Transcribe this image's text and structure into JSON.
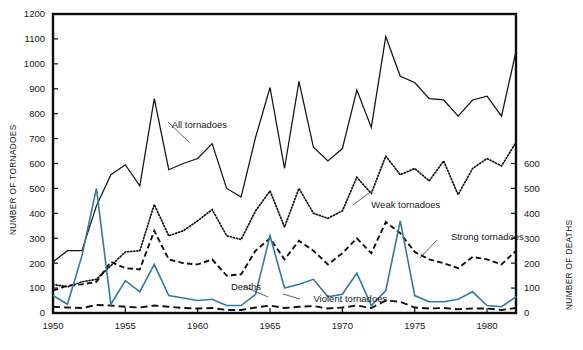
{
  "chart_data": {
    "type": "line",
    "title": "",
    "xlabel": "",
    "ylabel": "NUMBER OF TORNADOES",
    "y2label": "NUMBER OF DEATHS",
    "xlim": [
      1950,
      1982
    ],
    "ylim": [
      0,
      1200
    ],
    "y2lim": [
      0,
      600
    ],
    "grid": false,
    "legend_position": "inline-annotations",
    "x_ticks": [
      1950,
      1955,
      1960,
      1965,
      1970,
      1975,
      1980
    ],
    "x_tick_labels": [
      "1950",
      "1955",
      "1960",
      "1965",
      "1970",
      "1975",
      "1980"
    ],
    "y_ticks": [
      0,
      100,
      200,
      300,
      400,
      500,
      600,
      700,
      800,
      900,
      1000,
      1100,
      1200
    ],
    "y_tick_labels": [
      "0",
      "100",
      "200",
      "300",
      "400",
      "500",
      "600",
      "700",
      "800",
      "900",
      "1000",
      "1100",
      "1200"
    ],
    "y2_ticks": [
      0,
      100,
      200,
      300,
      400,
      500,
      600
    ],
    "y2_tick_labels": [
      "0",
      "100",
      "200",
      "300",
      "400",
      "500",
      "600"
    ],
    "x": [
      1950,
      1951,
      1952,
      1953,
      1954,
      1955,
      1956,
      1957,
      1958,
      1959,
      1960,
      1961,
      1962,
      1963,
      1964,
      1965,
      1966,
      1967,
      1968,
      1969,
      1970,
      1971,
      1972,
      1973,
      1974,
      1975,
      1976,
      1977,
      1978,
      1979,
      1980,
      1981,
      1982
    ],
    "series": [
      {
        "name": "All tornadoes",
        "style": "solid",
        "color": "#111111",
        "axis": "left",
        "label_text": "All tornadoes",
        "values": [
          205,
          250,
          250,
          430,
          555,
          595,
          510,
          860,
          575,
          600,
          620,
          680,
          500,
          465,
          705,
          905,
          580,
          930,
          665,
          610,
          660,
          895,
          745,
          1110,
          950,
          925,
          860,
          855,
          790,
          855,
          870,
          790,
          1050
        ]
      },
      {
        "name": "Weak tornadoes",
        "style": "dotted",
        "color": "#111111",
        "axis": "left",
        "label_text": "Weak tornadoes",
        "values": [
          115,
          105,
          125,
          135,
          190,
          245,
          250,
          435,
          310,
          330,
          370,
          415,
          310,
          295,
          410,
          490,
          345,
          500,
          400,
          380,
          410,
          545,
          480,
          630,
          555,
          580,
          530,
          610,
          475,
          580,
          620,
          590,
          685
        ]
      },
      {
        "name": "Strong tornadoes",
        "style": "dashed",
        "color": "#111111",
        "axis": "left",
        "label_text": "Strong tornadoes",
        "values": [
          90,
          110,
          115,
          125,
          205,
          180,
          175,
          330,
          215,
          200,
          195,
          215,
          150,
          155,
          250,
          300,
          215,
          290,
          250,
          195,
          240,
          300,
          240,
          365,
          320,
          245,
          215,
          200,
          180,
          225,
          215,
          195,
          250
        ]
      },
      {
        "name": "Violent tornadoes",
        "style": "long-dashed",
        "color": "#111111",
        "axis": "left",
        "label_text": "Violent tornadoes",
        "values": [
          25,
          22,
          20,
          32,
          30,
          25,
          22,
          30,
          25,
          20,
          18,
          20,
          12,
          12,
          22,
          30,
          20,
          25,
          28,
          18,
          22,
          30,
          20,
          50,
          45,
          22,
          18,
          20,
          15,
          18,
          18,
          12,
          20
        ]
      },
      {
        "name": "Deaths",
        "style": "solid",
        "color": "#2f7ba0",
        "axis": "right",
        "label_text": "Deaths",
        "values": [
          70,
          35,
          230,
          500,
          35,
          130,
          85,
          195,
          70,
          60,
          50,
          55,
          30,
          30,
          75,
          310,
          100,
          115,
          135,
          65,
          75,
          160,
          30,
          90,
          370,
          70,
          45,
          45,
          55,
          85,
          30,
          25,
          65
        ]
      }
    ],
    "annotations": [
      {
        "text": "All tornadoes",
        "x": 1958.2,
        "y_px": 128
      },
      {
        "text": "Weak tornadoes",
        "x": 1972.0,
        "y_px": 208
      },
      {
        "text": "Strong tornadoes",
        "x": 1977.5,
        "y_px": 240
      },
      {
        "text": "Deaths",
        "x": 1962.3,
        "y_px": 290
      },
      {
        "text": "Violent tornadoes",
        "x": 1968.0,
        "y_px": 302
      }
    ]
  }
}
